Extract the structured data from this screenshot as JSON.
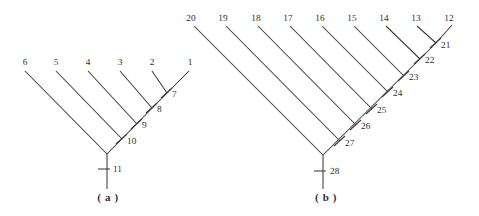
{
  "figure": {
    "width": 479,
    "height": 216,
    "background_color": "#ffffff",
    "line_color": "#3a3a3a",
    "text_color": "#2f2f2f",
    "type": "caterpillar-tree-pair"
  },
  "panels": [
    {
      "id": "a",
      "caption": "( a )",
      "caption_x": 108,
      "caption_y": 201,
      "apex": {
        "x": 107,
        "y": 154
      },
      "root_stem": {
        "x": 107,
        "y1": 154,
        "y2": 189
      },
      "leaves": [
        {
          "label": "6",
          "label_x": 25,
          "label_y": 65,
          "x": 25,
          "y": 71
        },
        {
          "label": "5",
          "label_x": 56,
          "label_y": 65,
          "x": 56,
          "y": 71
        },
        {
          "label": "4",
          "label_x": 88,
          "label_y": 65,
          "x": 88,
          "y": 71
        },
        {
          "label": "3",
          "label_x": 120,
          "label_y": 65,
          "x": 120,
          "y": 71
        },
        {
          "label": "2",
          "label_x": 152,
          "label_y": 65,
          "x": 152,
          "y": 71
        },
        {
          "label": "1",
          "label_x": 190,
          "label_y": 65,
          "x": 189,
          "y": 71
        }
      ],
      "nodes": [
        {
          "label": "7",
          "x": 167,
          "y": 93,
          "label_x": 172,
          "label_y": 97,
          "tick_x1": 161,
          "tick_y1": 98,
          "tick_x2": 172,
          "tick_y2": 88
        },
        {
          "label": "8",
          "x": 152,
          "y": 108,
          "label_x": 157,
          "label_y": 112,
          "tick_x1": 146,
          "tick_y1": 113,
          "tick_x2": 157,
          "tick_y2": 103
        },
        {
          "label": "9",
          "x": 137,
          "y": 124,
          "label_x": 142,
          "label_y": 128,
          "tick_x1": 131,
          "tick_y1": 129,
          "tick_x2": 142,
          "tick_y2": 119
        },
        {
          "label": "10",
          "x": 122,
          "y": 139,
          "label_x": 127,
          "label_y": 144,
          "tick_x1": 116,
          "tick_y1": 144,
          "tick_x2": 127,
          "tick_y2": 134
        },
        {
          "label": "11",
          "x": 107,
          "y": 169,
          "label_x": 113,
          "label_y": 172,
          "tick_x1": 98,
          "tick_y1": 169,
          "tick_x2": 110,
          "tick_y2": 169
        }
      ],
      "branches": [
        {
          "from": [
            25,
            71
          ],
          "to": [
            107,
            154
          ],
          "name": "leaf-6-branch"
        },
        {
          "from": [
            56,
            71
          ],
          "to": [
            122,
            139
          ],
          "name": "leaf-5-branch"
        },
        {
          "from": [
            88,
            71
          ],
          "to": [
            137,
            124
          ],
          "name": "leaf-4-branch"
        },
        {
          "from": [
            120,
            71
          ],
          "to": [
            152,
            108
          ],
          "name": "leaf-3-branch"
        },
        {
          "from": [
            152,
            71
          ],
          "to": [
            167,
            93
          ],
          "name": "leaf-2-branch"
        },
        {
          "from": [
            189,
            71
          ],
          "to": [
            167,
            93
          ],
          "name": "leaf-1-branch"
        },
        {
          "from": [
            167,
            93
          ],
          "to": [
            107,
            154
          ],
          "name": "spine-branch"
        }
      ]
    },
    {
      "id": "b",
      "caption": "( b )",
      "caption_x": 326,
      "caption_y": 201,
      "apex": {
        "x": 323,
        "y": 155
      },
      "root_stem": {
        "x": 323,
        "y1": 155,
        "y2": 189
      },
      "leaves": [
        {
          "label": "20",
          "label_x": 191,
          "label_y": 21,
          "x": 194,
          "y": 26
        },
        {
          "label": "19",
          "label_x": 223,
          "label_y": 21,
          "x": 226,
          "y": 26
        },
        {
          "label": "18",
          "label_x": 256,
          "label_y": 21,
          "x": 258,
          "y": 26
        },
        {
          "label": "17",
          "label_x": 288,
          "label_y": 21,
          "x": 290,
          "y": 26
        },
        {
          "label": "16",
          "label_x": 320,
          "label_y": 21,
          "x": 322,
          "y": 26
        },
        {
          "label": "15",
          "label_x": 352,
          "label_y": 21,
          "x": 354,
          "y": 26
        },
        {
          "label": "14",
          "label_x": 384,
          "label_y": 21,
          "x": 386,
          "y": 26
        },
        {
          "label": "13",
          "label_x": 416,
          "label_y": 21,
          "x": 417,
          "y": 26
        },
        {
          "label": "12",
          "label_x": 449,
          "label_y": 21,
          "x": 452,
          "y": 25
        }
      ],
      "nodes": [
        {
          "label": "21",
          "x": 436,
          "y": 43,
          "label_x": 441,
          "label_y": 48,
          "tick_x1": 430,
          "tick_y1": 48,
          "tick_x2": 441,
          "tick_y2": 38
        },
        {
          "label": "22",
          "x": 420,
          "y": 59,
          "label_x": 425,
          "label_y": 63,
          "tick_x1": 414,
          "tick_y1": 64,
          "tick_x2": 425,
          "tick_y2": 54
        },
        {
          "label": "23",
          "x": 404,
          "y": 76,
          "label_x": 409,
          "label_y": 80,
          "tick_x1": 398,
          "tick_y1": 81,
          "tick_x2": 409,
          "tick_y2": 71
        },
        {
          "label": "24",
          "x": 388,
          "y": 92,
          "label_x": 393,
          "label_y": 96,
          "tick_x1": 382,
          "tick_y1": 97,
          "tick_x2": 393,
          "tick_y2": 87
        },
        {
          "label": "25",
          "x": 372,
          "y": 109,
          "label_x": 377,
          "label_y": 113,
          "tick_x1": 366,
          "tick_y1": 114,
          "tick_x2": 377,
          "tick_y2": 104
        },
        {
          "label": "26",
          "x": 356,
          "y": 125,
          "label_x": 361,
          "label_y": 129,
          "tick_x1": 350,
          "tick_y1": 130,
          "tick_x2": 361,
          "tick_y2": 120
        },
        {
          "label": "27",
          "x": 340,
          "y": 141,
          "label_x": 345,
          "label_y": 146,
          "tick_x1": 334,
          "tick_y1": 146,
          "tick_x2": 345,
          "tick_y2": 136
        },
        {
          "label": "28",
          "x": 323,
          "y": 171,
          "label_x": 330,
          "label_y": 174,
          "tick_x1": 314,
          "tick_y1": 171,
          "tick_x2": 326,
          "tick_y2": 171
        }
      ],
      "branches": [
        {
          "from": [
            194,
            26
          ],
          "to": [
            323,
            155
          ],
          "name": "leaf-20-branch"
        },
        {
          "from": [
            226,
            26
          ],
          "to": [
            340,
            141
          ],
          "name": "leaf-19-branch"
        },
        {
          "from": [
            258,
            26
          ],
          "to": [
            356,
            125
          ],
          "name": "leaf-18-branch"
        },
        {
          "from": [
            290,
            26
          ],
          "to": [
            372,
            109
          ],
          "name": "leaf-17-branch"
        },
        {
          "from": [
            322,
            26
          ],
          "to": [
            388,
            92
          ],
          "name": "leaf-16-branch"
        },
        {
          "from": [
            354,
            26
          ],
          "to": [
            404,
            76
          ],
          "name": "leaf-15-branch"
        },
        {
          "from": [
            386,
            26
          ],
          "to": [
            420,
            59
          ],
          "name": "leaf-14-branch"
        },
        {
          "from": [
            417,
            26
          ],
          "to": [
            436,
            43
          ],
          "name": "leaf-13-branch"
        },
        {
          "from": [
            452,
            25
          ],
          "to": [
            436,
            43
          ],
          "name": "leaf-12-branch"
        },
        {
          "from": [
            436,
            43
          ],
          "to": [
            323,
            155
          ],
          "name": "spine-branch"
        }
      ]
    }
  ]
}
